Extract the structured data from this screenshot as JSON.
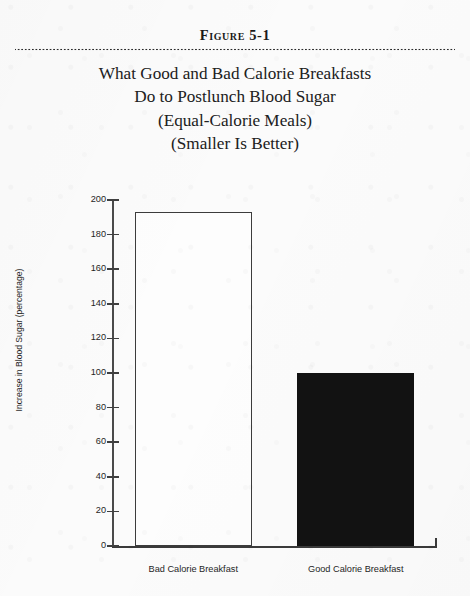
{
  "figure": {
    "number_label": "Figure 5-1",
    "title_lines": [
      "What Good and Bad Calorie Breakfasts",
      "Do to Postlunch Blood Sugar",
      "(Equal-Calorie Meals)",
      "(Smaller Is Better)"
    ]
  },
  "chart_data": {
    "type": "bar",
    "title": "What Good and Bad Calorie Breakfasts Do to Postlunch Blood Sugar (Equal-Calorie Meals) (Smaller Is Better)",
    "categories": [
      "Bad Calorie Breakfast",
      "Good Calorie Breakfast"
    ],
    "values": [
      193,
      100
    ],
    "xlabel": "",
    "ylabel": "Increase in Blood Sugar (percentage)",
    "ylim": [
      0,
      200
    ],
    "ytick_step": 20,
    "yticks": [
      0,
      20,
      40,
      60,
      80,
      100,
      120,
      140,
      160,
      180,
      200
    ],
    "ytick_labels": [
      "0",
      "20",
      "40",
      "60",
      "80",
      "100",
      "120",
      "140",
      "160",
      "180",
      "200"
    ],
    "grid": false,
    "legend": false,
    "bar_styles": [
      {
        "name": "Bad Calorie Breakfast",
        "fill": "#fdfdfd",
        "edge": "#3c3c3c"
      },
      {
        "name": "Good Calorie Breakfast",
        "fill": "#121212",
        "edge": "#121212"
      }
    ]
  }
}
